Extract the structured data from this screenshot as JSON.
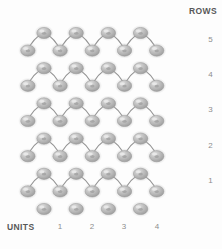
{
  "diagram": {
    "type": "lattice-grid",
    "colors": {
      "background": "#fdfdfd",
      "node_fill": "#b4b4b4",
      "node_highlight": "#dcdcdc",
      "node_shadow": "#909090",
      "link_stroke": "#8a8a8a",
      "axis_title_color": "#585858",
      "tick_color": "#8d8d8d"
    },
    "geometry": {
      "origin_x": 44,
      "origin_y": 33,
      "step_x": 32.2,
      "step_y": 35.2,
      "cols": 4,
      "rows": 5,
      "node_rx": 7.2,
      "node_ry": 5.6
    }
  },
  "axes": {
    "rows": {
      "title": "ROWS",
      "ticks": [
        {
          "label": "5",
          "y": 40
        },
        {
          "label": "4",
          "y": 75
        },
        {
          "label": "3",
          "y": 110
        },
        {
          "label": "2",
          "y": 146
        },
        {
          "label": "1",
          "y": 181
        }
      ]
    },
    "units": {
      "title": "UNITS",
      "ticks": [
        {
          "label": "1",
          "x": 54
        },
        {
          "label": "2",
          "x": 86
        },
        {
          "label": "3",
          "x": 118
        },
        {
          "label": "4",
          "x": 151
        }
      ]
    }
  }
}
